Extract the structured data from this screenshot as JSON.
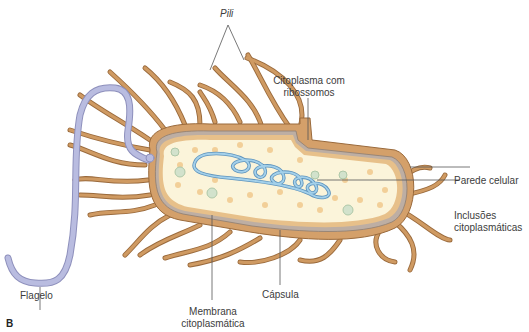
{
  "figure": {
    "panel_letter": "B",
    "colors": {
      "pili": "#c8925a",
      "pili_outline": "#9a6a3c",
      "capsule": "#d9a76f",
      "cell_wall": "#b9aaa0",
      "membrane": "#e9c48f",
      "cytoplasm": "#fbf3d8",
      "ribosome": "#f2cf98",
      "inclusion": "#c9dcc4",
      "dna": "#7fb6d8",
      "flagellum": "#b7b9dc",
      "leader_line": "#555555"
    }
  },
  "labels": {
    "pili": "Pili",
    "citoplasma_line1": "Citoplasma com",
    "citoplasma_line2": "ribossomos",
    "parede": "Parede celular",
    "inclusoes_line1": "Inclusões",
    "inclusoes_line2": "citoplasmáticas",
    "flagelo": "Flagelo",
    "capsula": "Cápsula",
    "membrana_line1": "Membrana",
    "membrana_line2": "citoplasmática"
  }
}
